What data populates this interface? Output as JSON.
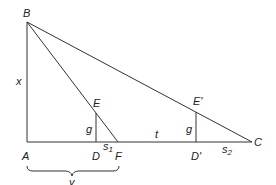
{
  "diagram": {
    "type": "geometry-triangle",
    "points": {
      "B": {
        "label": "B",
        "x": 27,
        "y": 22
      },
      "A": {
        "label": "A",
        "x": 27,
        "y": 142
      },
      "D": {
        "label": "D",
        "x": 96,
        "y": 142
      },
      "F": {
        "label": "F",
        "x": 118,
        "y": 142
      },
      "Dp": {
        "label": "D'",
        "x": 196,
        "y": 142
      },
      "C": {
        "label": "C",
        "x": 252,
        "y": 142
      },
      "E": {
        "label": "E",
        "x": 96,
        "y": 113
      },
      "Ep": {
        "label": "E'",
        "x": 196,
        "y": 112
      }
    },
    "segment_labels": {
      "x": "x",
      "y": "y",
      "g1": "g",
      "g2": "g",
      "t": "t",
      "s1_base": "s",
      "s1_sub": "1",
      "s2_base": "s",
      "s2_sub": "2"
    }
  }
}
